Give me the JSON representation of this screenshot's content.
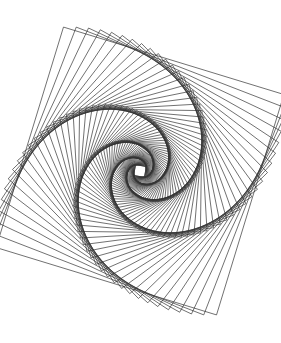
{
  "figure": {
    "type": "geometric-line-figure",
    "canvas": {
      "width": 281,
      "height": 343,
      "background_color": "#ffffff"
    },
    "stroke": {
      "color": "#333333",
      "width": 0.7,
      "linejoin": "miter"
    }
  },
  "chart_data": {
    "type": "line",
    "subtitle": "Nested squares rotated and scaled about a common center",
    "xlabel": "",
    "ylabel": "",
    "xlim": [
      0,
      281
    ],
    "ylim": [
      0,
      343
    ],
    "grid": false,
    "legend": "none",
    "annotations": [],
    "construction": {
      "shape": "square",
      "center_x": 140,
      "center_y": 171,
      "start_half_diagonal": 163,
      "start_angle_deg": -118,
      "rotation_step_deg": 4.1,
      "scale_ratio": 0.9655,
      "count": 88,
      "arms": 4,
      "envelope": "logarithmic-spiral"
    },
    "series": [
      {
        "name": "square-vertex-spiral-arm-1",
        "vertex_index": 0,
        "values": []
      },
      {
        "name": "square-vertex-spiral-arm-2",
        "vertex_index": 1,
        "values": []
      },
      {
        "name": "square-vertex-spiral-arm-3",
        "vertex_index": 2,
        "values": []
      },
      {
        "name": "square-vertex-spiral-arm-4",
        "vertex_index": 3,
        "values": []
      }
    ],
    "extents": {
      "leftmost_x": 5,
      "rightmost_x": 275,
      "topmost_y": 14,
      "bottommost_y": 335
    }
  }
}
